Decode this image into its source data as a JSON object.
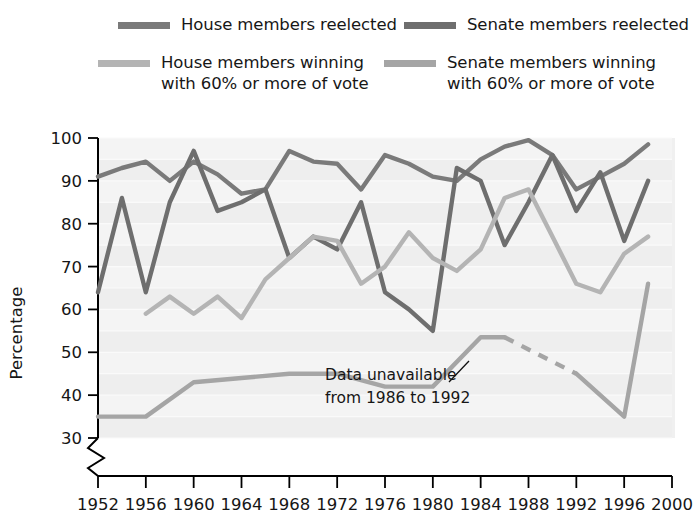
{
  "legend": {
    "items": [
      {
        "id": "house-reelected",
        "label": "House members reelected",
        "color": "#7a7a7a"
      },
      {
        "id": "house-60",
        "label": "House members winning\nwith 60% or more of vote",
        "color": "#b4b4b4"
      },
      {
        "id": "senate-reelected",
        "label": "Senate members reelected",
        "color": "#6e6e6e"
      },
      {
        "id": "senate-60",
        "label": "Senate members winning\nwith 60% or more of vote",
        "color": "#a5a5a5"
      }
    ]
  },
  "annotation": {
    "line1": "Data unavailable",
    "line2": "from 1986 to 1992"
  },
  "chart_data": {
    "type": "line",
    "title": "",
    "xlabel": "",
    "ylabel": "Percentage",
    "xlim": [
      1952,
      2000
    ],
    "ylim": [
      30,
      100
    ],
    "yticks": [
      30,
      40,
      50,
      60,
      70,
      80,
      90,
      100
    ],
    "xticks": [
      1952,
      1956,
      1960,
      1964,
      1968,
      1972,
      1976,
      1980,
      1984,
      1988,
      1992,
      1996,
      2000
    ],
    "axis_break": true,
    "grid": "horizontal-bands",
    "legend_position": "above-plot",
    "background": "#f0f0f0",
    "series": [
      {
        "name": "House members reelected",
        "color": "#7a7a7a",
        "x": [
          1952,
          1954,
          1956,
          1958,
          1960,
          1962,
          1964,
          1966,
          1968,
          1970,
          1972,
          1974,
          1976,
          1978,
          1980,
          1982,
          1984,
          1986,
          1988,
          1990,
          1992,
          1994,
          1996,
          1998
        ],
        "y": [
          91,
          93,
          94.5,
          90,
          94.5,
          91.5,
          87,
          88,
          97,
          94.5,
          94,
          88,
          96,
          94,
          91,
          90,
          95,
          98,
          99.5,
          96,
          88,
          91,
          94,
          98.5
        ]
      },
      {
        "name": "Senate members reelected",
        "color": "#6e6e6e",
        "x": [
          1952,
          1954,
          1956,
          1958,
          1960,
          1962,
          1964,
          1966,
          1968,
          1970,
          1972,
          1974,
          1976,
          1978,
          1980,
          1982,
          1984,
          1986,
          1988,
          1990,
          1992,
          1994,
          1996,
          1998
        ],
        "y": [
          64,
          86,
          64,
          85,
          97,
          83,
          85,
          88,
          72,
          77,
          74,
          85,
          64,
          60,
          55,
          93,
          90,
          75,
          85,
          96,
          83,
          92,
          76,
          90
        ]
      },
      {
        "name": "House members winning with 60% or more of vote",
        "color": "#b4b4b4",
        "x": [
          1956,
          1958,
          1960,
          1962,
          1964,
          1966,
          1968,
          1970,
          1972,
          1974,
          1976,
          1978,
          1980,
          1982,
          1984,
          1986,
          1988,
          1990,
          1992,
          1994,
          1996,
          1998
        ],
        "y": [
          59,
          63,
          59,
          63,
          58,
          67,
          72,
          77,
          76,
          66,
          70,
          78,
          72,
          69,
          74,
          86,
          88,
          77,
          66,
          64,
          73,
          77
        ]
      },
      {
        "name": "Senate members winning with 60% or more of vote",
        "color": "#a5a5a5",
        "x": [
          1952,
          1956,
          1960,
          1964,
          1968,
          1972,
          1976,
          1980,
          1984,
          1986,
          1992,
          1996,
          1998
        ],
        "y": [
          35,
          35,
          43,
          44,
          45,
          45,
          42,
          42,
          53.5,
          53.5,
          45,
          35,
          66
        ],
        "dashed_segment": {
          "from_x": 1986,
          "to_x": 1992,
          "reason": "Data unavailable from 1986 to 1992"
        }
      }
    ]
  }
}
